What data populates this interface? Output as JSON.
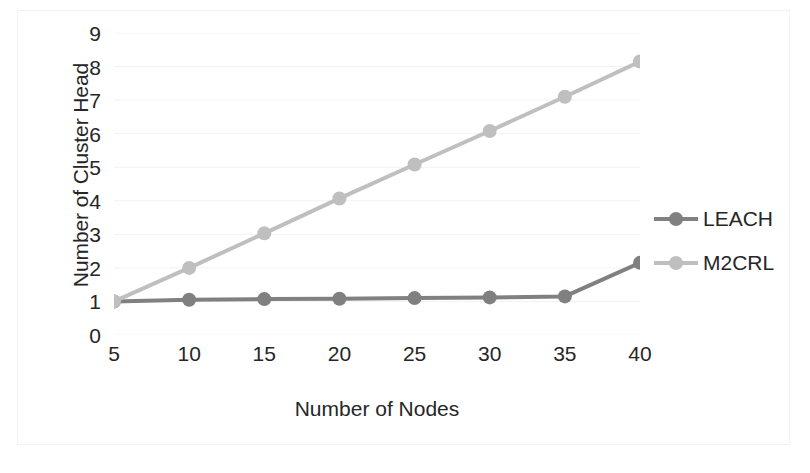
{
  "chart_data": {
    "type": "line",
    "title": "",
    "xlabel": "Number of Nodes",
    "ylabel": "Number of Cluster Head",
    "x": [
      5,
      10,
      15,
      20,
      25,
      30,
      35,
      40
    ],
    "xtick_labels": [
      "5",
      "10",
      "15",
      "20",
      "25",
      "30",
      "35",
      "40"
    ],
    "ytick_labels": [
      "0",
      "1",
      "2",
      "3",
      "4",
      "5",
      "6",
      "7",
      "8",
      "9"
    ],
    "xlim": [
      5,
      40
    ],
    "ylim": [
      0,
      9
    ],
    "grid": "horizontal",
    "legend_position": "right",
    "series": [
      {
        "name": "LEACH",
        "color": "#808080",
        "marker": "circle",
        "values": [
          1.0,
          1.05,
          1.07,
          1.08,
          1.1,
          1.12,
          1.15,
          2.15
        ]
      },
      {
        "name": "M2CRL",
        "color": "#bfbfbf",
        "marker": "circle",
        "values": [
          1.0,
          2.0,
          3.03,
          4.07,
          5.08,
          6.08,
          7.1,
          8.15
        ]
      }
    ]
  },
  "legend": {
    "entries": [
      {
        "label": "LEACH"
      },
      {
        "label": "M2CRL"
      }
    ]
  },
  "colors": {
    "text": "#262626",
    "gridline": "#f2f2f2",
    "frame": "#f2f2f2",
    "series_leach": "#808080",
    "series_m2crl": "#bfbfbf"
  }
}
